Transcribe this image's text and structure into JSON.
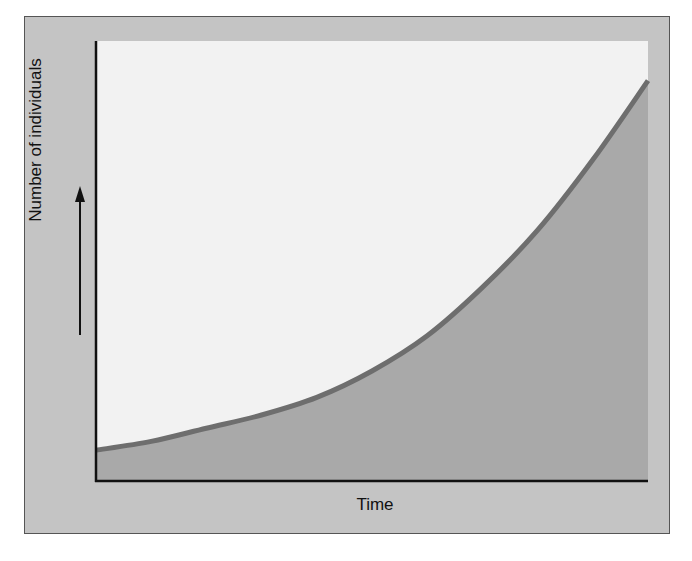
{
  "chart_data": {
    "type": "line",
    "title": "",
    "xlabel": "Time",
    "ylabel": "Number of individuals",
    "y_arrow": "up-arrow",
    "grid": false,
    "legend": null,
    "x_ticks": [],
    "y_ticks": [],
    "x": [
      0,
      0.1,
      0.2,
      0.3,
      0.4,
      0.5,
      0.6,
      0.7,
      0.8,
      0.9,
      1.0
    ],
    "series": [
      {
        "name": "population",
        "values": [
          0.07,
          0.09,
          0.12,
          0.15,
          0.19,
          0.25,
          0.33,
          0.44,
          0.57,
          0.73,
          0.91
        ]
      }
    ],
    "xlim": [
      0,
      1
    ],
    "ylim": [
      0,
      1
    ],
    "colors": {
      "curve": "#6e6e6e",
      "fill_under": "#a9a9a9",
      "fill_above": "#f2f2f2",
      "frame": "#c4c4c4",
      "axis": "#111111"
    }
  },
  "labels": {
    "x_axis": "Time",
    "y_axis": "Number of individuals"
  }
}
